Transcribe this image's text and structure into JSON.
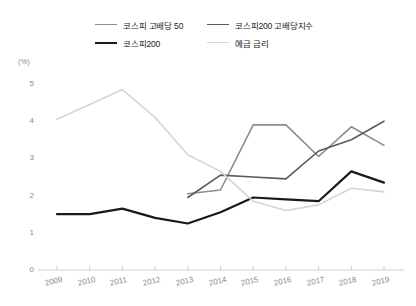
{
  "legend": {
    "items": [
      {
        "label": "코스피 고배당 50",
        "color": "#8c8c8c",
        "width": 1.6,
        "key": "kospi_high_div_50"
      },
      {
        "label": "코스피200 고배당지수",
        "color": "#5a5a5a",
        "width": 1.6,
        "key": "kospi200_high_div_index"
      },
      {
        "label": "코스피200",
        "color": "#1a1a1a",
        "width": 2.2,
        "key": "kospi200"
      },
      {
        "label": "예금 금리",
        "color": "#d5d5d5",
        "width": 1.6,
        "key": "deposit_rate"
      }
    ]
  },
  "axes": {
    "y_unit": "(%)",
    "y_ticks": [
      "0",
      "1",
      "2",
      "3",
      "4",
      "5"
    ],
    "x_ticks": [
      "2009",
      "2010",
      "2011",
      "2012",
      "2013",
      "2014",
      "2015",
      "2016",
      "2017",
      "2018",
      "2019"
    ]
  },
  "chart_data": {
    "type": "line",
    "title": "",
    "subtitle": "",
    "xlabel": "",
    "ylabel": "(%)",
    "ylim": [
      0,
      5.3
    ],
    "xlim": [
      2009,
      2019
    ],
    "grid": false,
    "legend_position": "top",
    "categories": [
      2009,
      2010,
      2011,
      2012,
      2013,
      2014,
      2015,
      2016,
      2017,
      2018,
      2019
    ],
    "series": [
      {
        "name": "코스피 고배당 50",
        "color": "#8c8c8c",
        "values": [
          null,
          null,
          null,
          null,
          2.05,
          2.15,
          3.9,
          3.9,
          3.05,
          3.85,
          3.35
        ]
      },
      {
        "name": "코스피200 고배당지수",
        "color": "#5a5a5a",
        "values": [
          null,
          null,
          null,
          null,
          1.95,
          2.55,
          2.5,
          2.45,
          3.2,
          3.5,
          4.0
        ]
      },
      {
        "name": "코스피200",
        "color": "#1a1a1a",
        "values": [
          1.5,
          1.5,
          1.65,
          1.4,
          1.25,
          1.55,
          1.95,
          1.9,
          1.85,
          2.65,
          2.35
        ]
      },
      {
        "name": "예금 금리",
        "color": "#d5d5d5",
        "values": [
          4.05,
          4.45,
          4.85,
          4.1,
          3.1,
          2.65,
          1.85,
          1.6,
          1.75,
          2.2,
          2.1
        ]
      }
    ]
  }
}
